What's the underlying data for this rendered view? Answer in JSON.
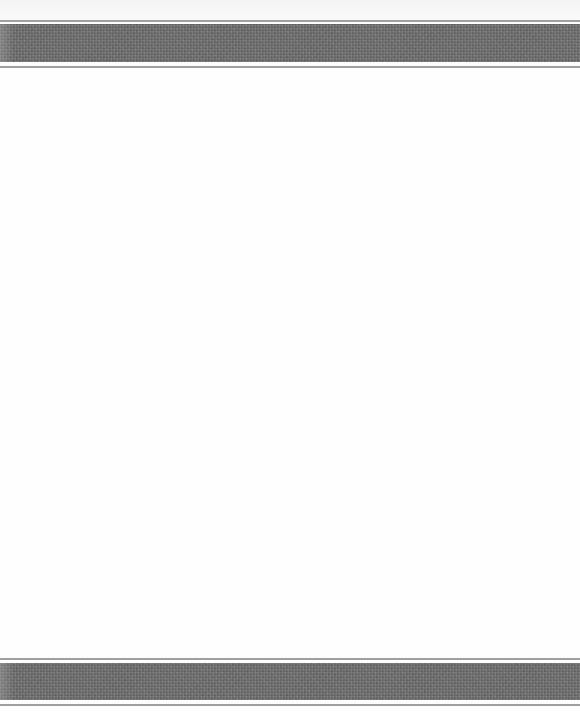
{
  "image": {
    "width": 580,
    "height": 711,
    "background_color": "#fdfdfd",
    "description": "woven textile with dark gray stripes at top and bottom edges"
  },
  "stripes": {
    "band_color": "#6d6d6d",
    "thin_line_color": "#8e8e8e",
    "top": {
      "upper_line_y": 20,
      "band_top_y": 24,
      "band_bottom_y": 62,
      "lower_line_y": 67
    },
    "bottom": {
      "upper_line_y": 659,
      "band_top_y": 663,
      "band_bottom_y": 700,
      "lower_line_y": 705
    }
  }
}
